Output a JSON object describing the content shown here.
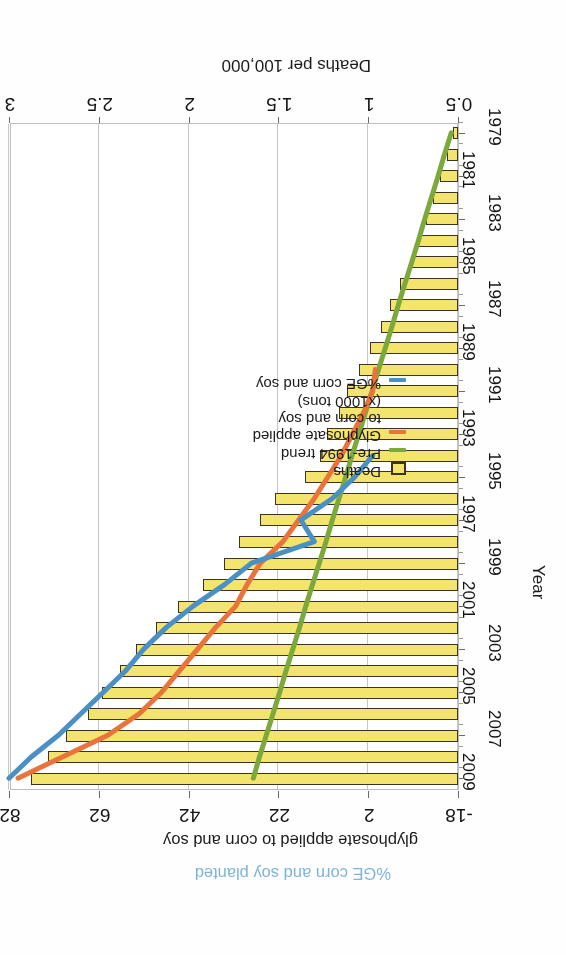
{
  "chart_data": {
    "type": "bar",
    "orientation": "horizontal",
    "title": "",
    "xlabel": "Deaths per 100,000",
    "ylabel": "Year",
    "xlim": [
      0.5,
      3
    ],
    "xticks": [
      "0.5",
      "1",
      "1.5",
      "2",
      "2.5",
      "3"
    ],
    "secondary_axis": {
      "labels": [
        "glyphosate applied to corn and soy",
        "%GE corn and soy planted"
      ],
      "ticks": [
        "-18",
        "2",
        "22",
        "42",
        "62",
        "82"
      ],
      "lim": [
        -18,
        82
      ]
    },
    "grid": true,
    "legend_position": "lower-left",
    "legend": [
      {
        "label": "Deaths",
        "key": "box",
        "color": "#f2e46d"
      },
      {
        "label": "Pre-1994 trend",
        "key": "line",
        "color": "#7da83c"
      },
      {
        "label": "Glyphosate applied",
        "label2": "to corn and soy",
        "label3": "(x1000 tons)",
        "key": "line",
        "color": "#e8743b"
      },
      {
        "label": "%GE corn and soy",
        "key": "line",
        "color": "#4a90c4"
      }
    ],
    "categories": [
      "1979",
      "1980",
      "1981",
      "1982",
      "1983",
      "1984",
      "1985",
      "1986",
      "1987",
      "1988",
      "1989",
      "1990",
      "1991",
      "1992",
      "1993",
      "1994",
      "1995",
      "1996",
      "1997",
      "1998",
      "1999",
      "2000",
      "2001",
      "2002",
      "2003",
      "2004",
      "2005",
      "2006",
      "2007",
      "2008",
      "2009"
    ],
    "ytick_labels": [
      "1979",
      "1981",
      "1983",
      "1985",
      "1987",
      "1989",
      "1991",
      "1993",
      "1995",
      "1997",
      "1999",
      "2001",
      "2003",
      "2005",
      "2007",
      "2009"
    ],
    "series": [
      {
        "name": "Deaths",
        "axis": "primary",
        "values": [
          0.53,
          0.56,
          0.6,
          0.64,
          0.68,
          0.72,
          0.76,
          0.82,
          0.88,
          0.93,
          0.99,
          1.05,
          1.12,
          1.16,
          1.23,
          1.27,
          1.35,
          1.52,
          1.6,
          1.72,
          1.8,
          1.92,
          2.06,
          2.18,
          2.29,
          2.38,
          2.48,
          2.56,
          2.68,
          2.78,
          2.88
        ]
      },
      {
        "name": "Pre-1994 trend",
        "axis": "secondary",
        "color": "#7da83c",
        "values": [
          -16.5,
          -15.0,
          -13.6,
          -12.1,
          -10.6,
          -9.2,
          -7.7,
          -6.2,
          -4.7,
          -3.3,
          -1.8,
          -0.3,
          1.1,
          2.6,
          4.1,
          5.6,
          7.0,
          8.5,
          10.0,
          11.4,
          12.9,
          14.4,
          15.9,
          17.3,
          18.8,
          20.3,
          21.7,
          23.2,
          24.7,
          26.2,
          27.6
        ]
      },
      {
        "name": "Glyphosate applied to corn and soy (x1000 tons)",
        "axis": "secondary",
        "color": "#e8743b",
        "values": [
          null,
          null,
          null,
          null,
          null,
          null,
          null,
          null,
          null,
          null,
          null,
          0.4,
          1.0,
          3.0,
          5.5,
          8.0,
          11.0,
          14.0,
          17.5,
          21.0,
          26.0,
          29.0,
          31.5,
          36.0,
          40.0,
          44.0,
          48.0,
          53.0,
          60.0,
          70.0,
          80.0
        ]
      },
      {
        "name": "%GE corn and soy",
        "axis": "secondary",
        "color": "#4a90c4",
        "values": [
          null,
          null,
          null,
          null,
          null,
          null,
          null,
          null,
          null,
          null,
          null,
          null,
          null,
          null,
          null,
          1.0,
          5.0,
          10.0,
          17.0,
          14.0,
          28.0,
          34.0,
          41.0,
          47.0,
          52.0,
          56.0,
          61.0,
          66.0,
          71.0,
          77.0,
          82.0
        ]
      }
    ]
  },
  "axis": {
    "primary_title": "Deaths per 100,000",
    "category_title": "Year",
    "secondary_title_1": "glyphosate applied to corn and soy",
    "secondary_title_2": "%GE corn and soy planted"
  }
}
